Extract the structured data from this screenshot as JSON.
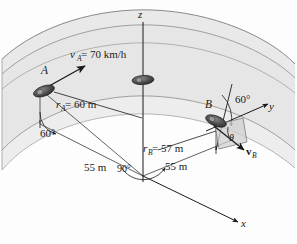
{
  "figure": {
    "background_color": "#fdfdfd",
    "band_fill": "#e6e6e6",
    "band_stroke": "#8a8a8a",
    "line_color": "#1a1a1a",
    "vehicle_color": "#4a4a4a"
  },
  "axes": {
    "z_label": "z",
    "y_label": "y",
    "x_label": "x"
  },
  "points": {
    "a_label": "A",
    "b_label": "B"
  },
  "labels": {
    "v_a": "v",
    "v_a_sub": "A",
    "v_a_value": " = 70 km/h",
    "r_a": "r",
    "r_a_sub": "A",
    "r_a_value": " = 60 m",
    "r_b": "r",
    "r_b_sub": "B",
    "r_b_value": " = 57 m",
    "v_b": "v",
    "v_b_sub": "B",
    "angle_a": "60°",
    "angle_b": "60°",
    "angle_origin": "90°",
    "theta": "θ",
    "dim_left": "55 m",
    "dim_right": "55 m"
  }
}
